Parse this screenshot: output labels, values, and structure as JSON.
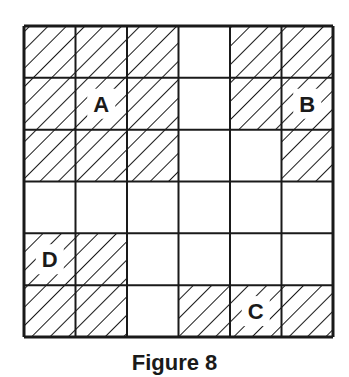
{
  "figure": {
    "caption": "Figure 8",
    "rows": 6,
    "cols": 6,
    "hatched": [
      [
        1,
        1,
        1,
        0,
        1,
        1
      ],
      [
        1,
        1,
        1,
        0,
        1,
        1
      ],
      [
        1,
        1,
        1,
        0,
        0,
        1
      ],
      [
        0,
        0,
        0,
        0,
        0,
        0
      ],
      [
        1,
        1,
        0,
        0,
        0,
        0
      ],
      [
        1,
        1,
        0,
        1,
        1,
        1
      ]
    ],
    "labels": [
      {
        "text": "A",
        "row": 1,
        "col": 1
      },
      {
        "text": "B",
        "row": 1,
        "col": 5
      },
      {
        "text": "C",
        "row": 5,
        "col": 4
      },
      {
        "text": "D",
        "row": 4,
        "col": 0
      }
    ],
    "colors": {
      "line": "#1a1a1a",
      "background": "#ffffff"
    }
  }
}
